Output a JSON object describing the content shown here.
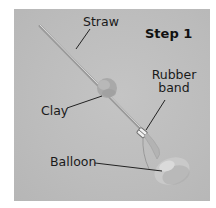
{
  "figure": {
    "title": "Step 1",
    "labels": {
      "straw": "Straw",
      "clay": "Clay",
      "rubber_band_line1": "Rubber",
      "rubber_band_line2": "band",
      "balloon": "Balloon"
    },
    "colors": {
      "photo_background": "#bdbdbd",
      "label_text": "#1a1a1a",
      "leader_line": "#222222",
      "page_background": "#ffffff"
    }
  }
}
